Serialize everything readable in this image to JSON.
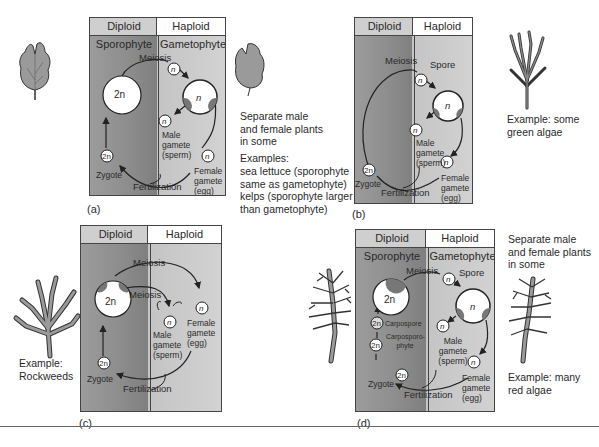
{
  "figure": {
    "panels": [
      {
        "id": "a",
        "caption": "(a)",
        "header": {
          "diploid": "Diploid",
          "haploid": "Haploid"
        },
        "subheader": {
          "diploid": "Sporophyte",
          "haploid": "Gametophyte"
        },
        "labels": {
          "meiosis": "Meiosis",
          "fertilization": "Fertilization",
          "zygote": "Zygote",
          "sporophyte_cell": "2n",
          "zygote_cell": "2n",
          "gametophyte_cell": "n",
          "spore_cell": "n",
          "male_cell": "n",
          "female_cell": "n",
          "male": "Male gamete (sperm)",
          "female": "Female gamete (egg)"
        },
        "side_text": {
          "note": "Separate male and female plants in some",
          "examples_title": "Examples:",
          "examples": [
            "sea lettuce (sporophyte same as gametophyte)",
            "kelps (sporophyte larger than gametophyte)"
          ]
        }
      },
      {
        "id": "b",
        "caption": "(b)",
        "header": {
          "diploid": "Diploid",
          "haploid": "Haploid"
        },
        "labels": {
          "meiosis": "Meiosis",
          "spore": "Spore",
          "fertilization": "Fertilization",
          "zygote": "Zygote",
          "zygote_cell": "2n",
          "spore_cell": "n",
          "gametophyte_cell": "n",
          "male_cell": "n",
          "female_cell": "n",
          "male": "Male gamete (sperm)",
          "female": "Female gamete (egg)"
        },
        "side_text": {
          "example": "Example: some green algae"
        }
      },
      {
        "id": "c",
        "caption": "(c)",
        "header": {
          "diploid": "Diploid",
          "haploid": "Haploid"
        },
        "labels": {
          "meiosis_outer": "Meiosis",
          "meiosis_inner": "Meiosis",
          "fertilization": "Fertilization",
          "zygote": "Zygote",
          "sporophyte_cell": "2n",
          "zygote_cell": "2n",
          "male_cell": "n",
          "female_cell": "n",
          "male": "Male gamete (sperm)",
          "female": "Female gamete (egg)"
        },
        "side_text": {
          "example": "Example: Rockweeds"
        }
      },
      {
        "id": "d",
        "caption": "(d)",
        "header": {
          "diploid": "Diploid",
          "haploid": "Haploid"
        },
        "subheader": {
          "diploid": "Sporophyte",
          "haploid": "Gametophyte"
        },
        "labels": {
          "meiosis": "Meiosis",
          "spore": "Spore",
          "fertilization": "Fertilization",
          "zygote": "Zygote",
          "carpospore": "Carpospore",
          "carposporophyte": "Carposporo-phyte",
          "sporophyte_cell": "2n",
          "carpospore_cell": "2n",
          "carposporophyte_cell": "2n",
          "zygote_cell": "2n",
          "spore_cell": "n",
          "gametophyte_cell": "n",
          "male_cell": "n",
          "female_cell": "n",
          "male": "Male gamete (sperm)",
          "female": "Female gamete (egg)"
        },
        "side_text": {
          "note": "Separate male and female plants in some",
          "example": "Example: many red algae"
        }
      }
    ]
  }
}
